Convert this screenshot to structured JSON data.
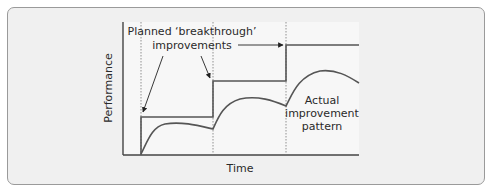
{
  "figure": {
    "labels": {
      "planned_line1": "Planned ‘breakthrough’",
      "planned_line2": "improvements",
      "actual_line1": "Actual",
      "actual_line2": "improvement",
      "actual_line3": "pattern",
      "y_axis": "Performance",
      "x_axis": "Time"
    },
    "colors": {
      "frame_bg": "#f0f0f0",
      "plot_bg": "#f7f7f7",
      "line": "#555555",
      "axis": "#444444",
      "dash": "#777777"
    }
  }
}
